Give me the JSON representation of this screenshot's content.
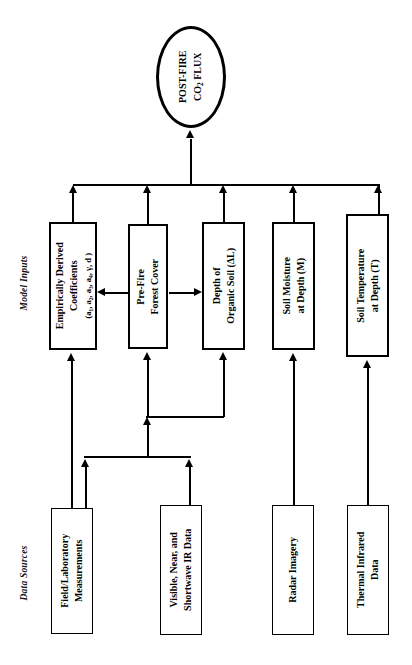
{
  "diagram": {
    "sections": {
      "model_inputs_label": "Model Inputs",
      "data_sources_label": "Data Sources"
    },
    "output_node": {
      "line1": "POST-FIRE",
      "line2_prefix": "CO",
      "line2_sub": "2",
      "line2_suffix": " FLUX"
    },
    "model_inputs": [
      {
        "id": "coefficients",
        "line1": "Empirically Derived",
        "line2": "Coefficients",
        "line3": "(a₁, a₂, a₃, a₄, γ, d )"
      },
      {
        "id": "forest-cover",
        "line1": "Pre-Fire",
        "line2": "Forest Cover",
        "line3": ""
      },
      {
        "id": "organic-soil-depth",
        "line1": "Depth of",
        "line2": "Organic Soil (ΔL)",
        "line3": ""
      },
      {
        "id": "soil-moisture",
        "line1": "Soil Moisture",
        "line2": "at Depth (M)",
        "line3": ""
      },
      {
        "id": "soil-temperature",
        "line1": "Soil Temperature",
        "line2": "at Depth (T)",
        "line3": ""
      }
    ],
    "data_sources": [
      {
        "id": "field-lab",
        "line1": "Field/Laboratory",
        "line2": "Measurements"
      },
      {
        "id": "visible-ir",
        "line1": "Visible, Near, and",
        "line2": "Shortwave IR Data"
      },
      {
        "id": "radar",
        "line1": "Radar Imagery",
        "line2": ""
      },
      {
        "id": "thermal-ir",
        "line1": "Thermal Infrared",
        "line2": "Data"
      }
    ],
    "colors": {
      "stroke": "#000000",
      "fill": "#ffffff"
    }
  }
}
